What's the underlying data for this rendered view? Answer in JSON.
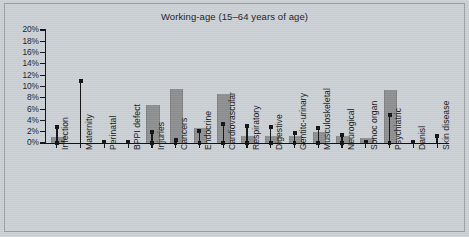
{
  "figure": {
    "title": "Working-age (15–64 years of age)",
    "background_color": "#ccd1d6",
    "bar_color": "#8d8f91",
    "marker_color": "#111111"
  },
  "axis": {
    "y_ticks": [
      "20%",
      "18%",
      "16%",
      "14%",
      "12%",
      "10%",
      "8%",
      "6%",
      "4%",
      "2%",
      "0%"
    ],
    "y_min": 0,
    "y_max": 20,
    "y_step": 2
  },
  "chart_data": {
    "type": "bar",
    "title": "Working-age (15–64 years of age)",
    "xlabel": "",
    "ylabel": "",
    "ylim": [
      0,
      20
    ],
    "ytick_labels": [
      "0%",
      "2%",
      "4%",
      "6%",
      "8%",
      "10%",
      "12%",
      "14%",
      "16%",
      "18%",
      "20%"
    ],
    "grid": false,
    "legend": "none",
    "categories": [
      "Infection",
      "Maternity",
      "Perinatal",
      "BPPI defect",
      "Injuries",
      "Cancers",
      "Endocrine",
      "Cardiovascular",
      "Respiratory",
      "Digestive",
      "Gentitc-urinary",
      "Musculoskeletal",
      "Neurogical",
      "Sonoc organ",
      "Psychiatric",
      "Danisl",
      "Skin disease"
    ],
    "series": [
      {
        "name": "Bar value",
        "values": [
          1.0,
          0.0,
          0.0,
          0.0,
          6.7,
          9.5,
          2.6,
          8.6,
          1.3,
          1.2,
          1.2,
          2.0,
          1.2,
          0.9,
          9.4,
          0.0,
          0.0
        ]
      },
      {
        "name": "Marker value",
        "values": [
          2.9,
          11.0,
          0.1,
          0.1,
          2.0,
          0.6,
          2.2,
          3.4,
          3.0,
          2.9,
          1.7,
          2.7,
          1.4,
          0.2,
          5.0,
          0.1,
          1.2
        ]
      }
    ]
  }
}
